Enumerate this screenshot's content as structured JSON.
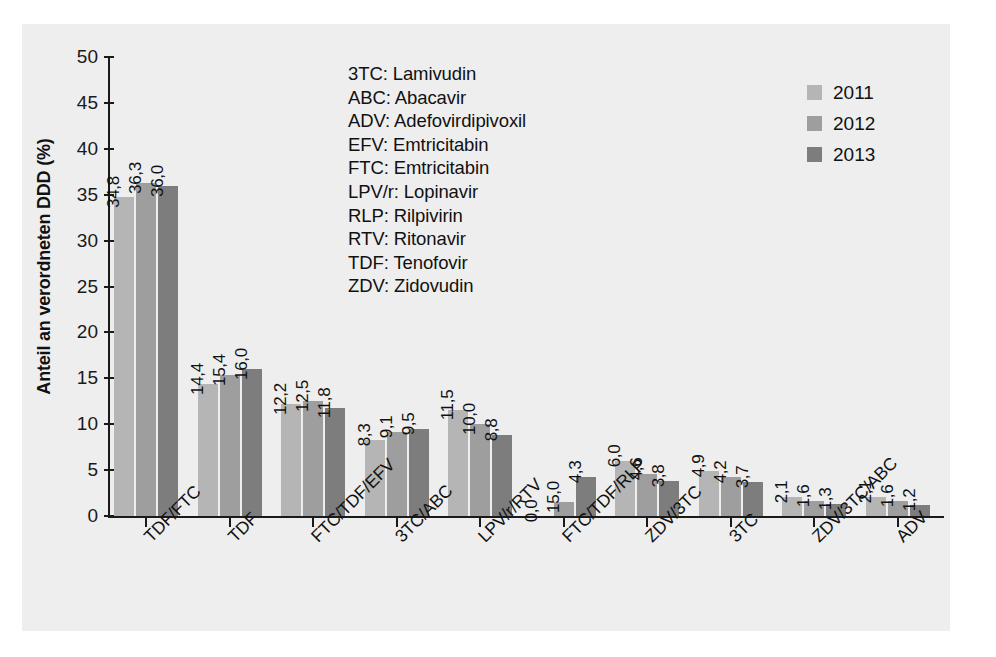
{
  "chart_data": {
    "type": "bar",
    "title": "",
    "xlabel": "",
    "ylabel": "Anteil an verordneten DDD (%)",
    "ylim": [
      0,
      50
    ],
    "ytick_step": 5,
    "yticks": [
      "50",
      "45",
      "40",
      "35",
      "30",
      "25",
      "20",
      "15",
      "10",
      "5",
      "0"
    ],
    "grid": false,
    "legend_position": "top-right",
    "categories": [
      "TDF/FTC",
      "TDF",
      "FTC/TDF/EFV",
      "3TC/ABC",
      "LPV/r/RTV",
      "FTC/TDF/RLP",
      "ZDV/3TC",
      "3TC",
      "ZDV/3TC/ABC",
      "ADV"
    ],
    "series": [
      {
        "name": "2011",
        "color": "#b5b5b5",
        "values": [
          34.8,
          14.4,
          12.2,
          8.3,
          11.5,
          0.0,
          6.0,
          4.9,
          2.1,
          2.1
        ],
        "labels": [
          "34,8",
          "14,4",
          "12,2",
          "8,3",
          "11,5",
          "0,0",
          "6,0",
          "4,9",
          "2,1",
          "2,1"
        ]
      },
      {
        "name": "2012",
        "color": "#9e9e9e",
        "values": [
          36.3,
          15.4,
          12.5,
          9.1,
          10.0,
          1.5,
          4.6,
          4.2,
          1.6,
          1.6
        ],
        "labels": [
          "36,3",
          "15,4",
          "12,5",
          "9,1",
          "10,0",
          "15,0",
          "4,6",
          "4,2",
          "1,6",
          "1,6"
        ]
      },
      {
        "name": "2013",
        "color": "#7d7d7d",
        "values": [
          36.0,
          16.0,
          11.8,
          9.5,
          8.8,
          4.3,
          3.8,
          3.7,
          1.3,
          1.2
        ],
        "labels": [
          "36,0",
          "16,0",
          "11,8",
          "9,5",
          "8,8",
          "4,3",
          "3,8",
          "3,7",
          "1,3",
          "1,2"
        ]
      }
    ]
  },
  "legend": {
    "entries": [
      {
        "label": "2011",
        "color": "#b5b5b5"
      },
      {
        "label": "2012",
        "color": "#9e9e9e"
      },
      {
        "label": "2013",
        "color": "#7d7d7d"
      }
    ]
  },
  "abbreviations": [
    "3TC: Lamivudin",
    "ABC: Abacavir",
    "ADV: Adefovirdipivoxil",
    "EFV: Emtricitabin",
    "FTC: Emtricitabin",
    "LPV/r: Lopinavir",
    "RLP: Rilpivirin",
    "RTV: Ritonavir",
    "TDF: Tenofovir",
    "ZDV: Zidovudin"
  ],
  "colors": {
    "panel_background": "#eeeeee",
    "page_background": "#ffffff",
    "axis": "#1a1a1a",
    "text": "#111111"
  }
}
